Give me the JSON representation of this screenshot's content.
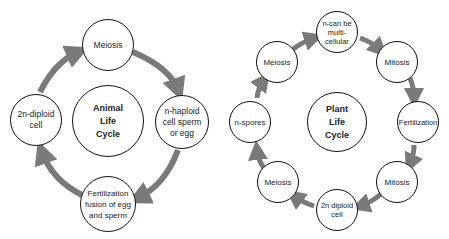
{
  "animal": {
    "center": [
      "Animal",
      "Life",
      "Cycle"
    ],
    "nodes": [
      {
        "lines": [
          "Meiosis"
        ]
      },
      {
        "lines": [
          "n-haploid",
          "cell sperm",
          "or egg"
        ]
      },
      {
        "lines": [
          "Fertilization",
          "fusion of egg",
          "and sperm"
        ]
      },
      {
        "lines": [
          "2n-diploid",
          "cell"
        ]
      }
    ]
  },
  "plant": {
    "center": [
      "Plant",
      "Life",
      "Cycle"
    ],
    "nodes": [
      {
        "lines": [
          "n-can be",
          "multi-",
          "cellular"
        ]
      },
      {
        "lines": [
          "Mitosis"
        ]
      },
      {
        "lines": [
          "Fertilization"
        ]
      },
      {
        "lines": [
          "Mitosis"
        ]
      },
      {
        "lines": [
          "2n diploid",
          "cell"
        ]
      },
      {
        "lines": [
          "Meiosis"
        ]
      },
      {
        "lines": [
          "n-spores"
        ]
      },
      {
        "lines": [
          "Meiosis"
        ]
      }
    ]
  },
  "colors": {
    "arrow": "#7a7a7a",
    "border": "#111111"
  }
}
